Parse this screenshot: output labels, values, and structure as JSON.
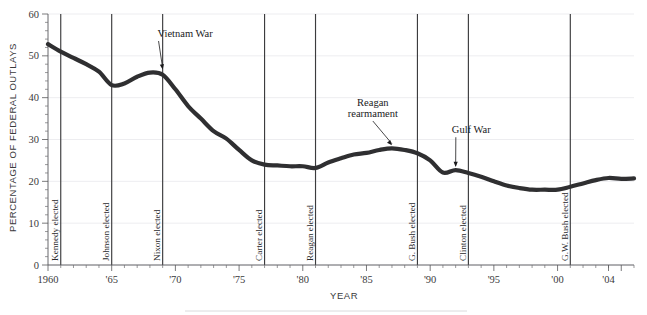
{
  "figure": {
    "ylabel": "PERCENTAGE OF FEDERAL OUTLAYS",
    "xlabel": "YEAR"
  },
  "chart_data": {
    "type": "line",
    "title": "",
    "subtitle": "",
    "xlabel": "YEAR",
    "ylabel": "PERCENTAGE OF FEDERAL OUTLAYS",
    "xlim": [
      1960,
      2006
    ],
    "ylim": [
      0,
      60
    ],
    "xtick_labels": [
      "1960",
      "'65",
      "'70",
      "'75",
      "'80",
      "'85",
      "'90",
      "'95",
      "'00",
      "'04"
    ],
    "xtick_values": [
      1960,
      1965,
      1970,
      1975,
      1980,
      1985,
      1990,
      1995,
      2000,
      2004
    ],
    "ytick_labels": [
      "0",
      "10",
      "20",
      "30",
      "40",
      "50",
      "60"
    ],
    "ytick_values": [
      0,
      10,
      20,
      30,
      40,
      50,
      60
    ],
    "grid": "horizontal",
    "legend": "none",
    "x": [
      1960,
      1961,
      1962,
      1963,
      1964,
      1965,
      1966,
      1967,
      1968,
      1969,
      1970,
      1971,
      1972,
      1973,
      1974,
      1975,
      1976,
      1977,
      1978,
      1979,
      1980,
      1981,
      1982,
      1983,
      1984,
      1985,
      1986,
      1987,
      1988,
      1989,
      1990,
      1991,
      1992,
      1993,
      1994,
      1995,
      1996,
      1997,
      1998,
      1999,
      2000,
      2001,
      2002,
      2003,
      2004,
      2005,
      2006
    ],
    "values": [
      52.8,
      51.0,
      49.5,
      48.0,
      46.2,
      43.0,
      43.4,
      45.0,
      46.0,
      45.5,
      42.0,
      38.0,
      35.0,
      32.0,
      30.2,
      27.5,
      25.0,
      24.0,
      23.8,
      23.6,
      23.6,
      23.2,
      24.5,
      25.5,
      26.4,
      26.8,
      27.5,
      27.9,
      27.5,
      26.7,
      25.0,
      22.1,
      22.7,
      22.0,
      21.1,
      20.0,
      19.0,
      18.4,
      18.0,
      18.0,
      18.0,
      18.7,
      19.5,
      20.3,
      20.8,
      20.6,
      20.7
    ],
    "annotations": [
      {
        "text": "Vietnam War",
        "x": 1969,
        "y": 46.0,
        "label_x": 1968.6,
        "label_y": 54.5
      },
      {
        "text": "Reagan rearmament",
        "x": 1987,
        "y": 27.9,
        "label_x": 1985.5,
        "label_y": 38.0
      },
      {
        "text": "Gulf War",
        "x": 1992,
        "y": 22.7,
        "label_x": 1991.7,
        "label_y": 31.5
      }
    ],
    "event_lines": [
      {
        "label": "Kennedy elected",
        "year": 1961
      },
      {
        "label": "Johnson elected",
        "year": 1965
      },
      {
        "label": "Nixon elected",
        "year": 1969
      },
      {
        "label": "Carter elected",
        "year": 1977
      },
      {
        "label": "Reagan elected",
        "year": 1981
      },
      {
        "label": "G. Bush elected",
        "year": 1989
      },
      {
        "label": "Clinton elected",
        "year": 1993
      },
      {
        "label": "G.W. Bush elected",
        "year": 2001
      }
    ],
    "colors": {
      "series": "#2f2f31",
      "grid": "#e9e9ec",
      "axis": "#58585b",
      "event_line": "#3c3c3e",
      "text": "#231f20",
      "background": "#ffffff"
    }
  }
}
